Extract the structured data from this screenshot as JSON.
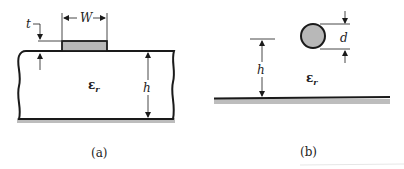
{
  "figure": {
    "panels": [
      {
        "id": "a",
        "caption": "(a)",
        "description": "Microstrip line on dielectric substrate over ground plane",
        "labels": {
          "width": "W",
          "thickness": "t",
          "height": "h",
          "permittivity": "ε",
          "permittivity_sub": "r"
        }
      },
      {
        "id": "b",
        "caption": "(b)",
        "description": "Round wire of diameter d at height h above ground plane in dielectric",
        "labels": {
          "diameter": "d",
          "height": "h",
          "permittivity": "ε",
          "permittivity_sub": "r"
        }
      }
    ],
    "colors": {
      "line": "#1a1a1a",
      "conductor_fill": "#b8b8b8",
      "ground_shadow": "#bdbdbd"
    }
  }
}
